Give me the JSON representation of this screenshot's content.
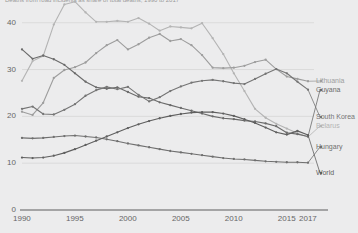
{
  "title": "Deaths from road incidents as share of total deaths, 1990 to 2017",
  "axes": {
    "y_ticks": [
      "40",
      "30",
      "20",
      "10",
      "0"
    ],
    "x_ticks": [
      "1990",
      "1995",
      "2000",
      "2005",
      "2010",
      "2015",
      "2017"
    ]
  },
  "legend": [
    {
      "label": "Lithuania",
      "color": "#9d9d9d"
    },
    {
      "label": "Guyana",
      "color": "#6b6b6b"
    },
    {
      "label": "South Korea",
      "color": "#757575"
    },
    {
      "label": "Belarus",
      "color": "#b4b4b4"
    },
    {
      "label": "Hungary",
      "color": "#6f6f6f"
    },
    {
      "label": "World",
      "color": "#5f5f5f"
    }
  ],
  "chart_data": {
    "type": "line",
    "title": "Deaths from road incidents as share of total deaths, 1990 to 2017",
    "xlabel": "",
    "ylabel": "",
    "xlim": [
      1990,
      2017
    ],
    "ylim": [
      0,
      44
    ],
    "grid": true,
    "legend_position": "right",
    "x": [
      1990,
      1991,
      1992,
      1993,
      1994,
      1995,
      1996,
      1997,
      1998,
      1999,
      2000,
      2001,
      2002,
      2003,
      2004,
      2005,
      2006,
      2007,
      2008,
      2009,
      2010,
      2011,
      2012,
      2013,
      2014,
      2015,
      2016,
      2017
    ],
    "series": [
      {
        "name": "Belarus",
        "color": "#b4b4b4",
        "values": [
          27.6,
          31.8,
          32.9,
          39.6,
          43.9,
          44.5,
          42.2,
          40.2,
          40.2,
          40.4,
          40.2,
          41.0,
          39.8,
          38.3,
          39.2,
          39.0,
          38.8,
          39.9,
          36.7,
          33.3,
          29.2,
          25.4,
          21.6,
          19.7,
          18.4,
          17.4,
          16.4,
          15.6
        ]
      },
      {
        "name": "Lithuania",
        "color": "#9d9d9d",
        "values": [
          21.0,
          20.3,
          22.9,
          28.2,
          29.9,
          30.5,
          31.5,
          33.5,
          35.2,
          36.3,
          34.3,
          35.4,
          36.8,
          37.6,
          36.1,
          36.5,
          35.2,
          33.1,
          30.4,
          30.3,
          30.4,
          30.8,
          31.6,
          32.1,
          30.1,
          28.5,
          28.0,
          27.5
        ]
      },
      {
        "name": "Guyana",
        "color": "#6b6b6b",
        "values": [
          34.3,
          32.3,
          33.0,
          32.2,
          31.0,
          29.2,
          27.4,
          26.2,
          25.9,
          26.2,
          25.2,
          24.2,
          23.9,
          23.0,
          22.4,
          21.8,
          21.2,
          20.6,
          20.0,
          19.6,
          19.4,
          19.1,
          18.9,
          18.5,
          17.9,
          16.5,
          16.2,
          15.7
        ]
      },
      {
        "name": "South Korea",
        "color": "#757575",
        "values": [
          21.6,
          22.1,
          20.5,
          20.4,
          21.4,
          22.6,
          24.4,
          25.6,
          26.3,
          25.8,
          26.3,
          24.6,
          23.2,
          24.1,
          25.4,
          26.4,
          27.2,
          27.6,
          27.8,
          27.5,
          27.1,
          26.9,
          28.0,
          29.1,
          30.1,
          29.2,
          27.4,
          25.7
        ]
      },
      {
        "name": "Hungary",
        "color": "#6f6f6f",
        "values": [
          15.4,
          15.3,
          15.4,
          15.6,
          15.8,
          15.9,
          15.7,
          15.5,
          15.1,
          14.7,
          14.2,
          13.8,
          13.4,
          13.0,
          12.6,
          12.3,
          12.0,
          11.7,
          11.4,
          11.1,
          10.9,
          10.8,
          10.6,
          10.4,
          10.3,
          10.2,
          10.2,
          10.1
        ]
      },
      {
        "name": "World",
        "color": "#5f5f5f",
        "values": [
          11.2,
          11.1,
          11.2,
          11.6,
          12.2,
          13.0,
          13.9,
          14.8,
          15.7,
          16.6,
          17.5,
          18.3,
          19.0,
          19.6,
          20.1,
          20.5,
          20.8,
          20.9,
          20.9,
          20.6,
          20.1,
          19.4,
          18.6,
          17.6,
          16.6,
          16.1,
          16.9,
          16.0
        ]
      }
    ]
  }
}
